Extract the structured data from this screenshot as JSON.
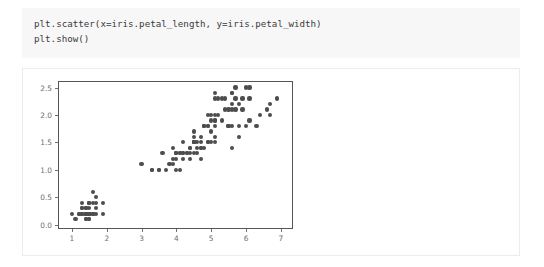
{
  "cell": {
    "code_lines": [
      "plt.scatter(x=iris.petal_length, y=iris.petal_width)",
      "plt.show()"
    ]
  },
  "chart_data": {
    "type": "scatter",
    "title": "",
    "xlabel": "",
    "ylabel": "",
    "xlim": [
      0.6,
      7.35
    ],
    "ylim": [
      -0.08,
      2.62
    ],
    "xticks": [
      1,
      2,
      3,
      4,
      5,
      6,
      7
    ],
    "xtick_labels": [
      "1",
      "2",
      "3",
      "4",
      "5",
      "6",
      "7"
    ],
    "yticks": [
      0.0,
      0.5,
      1.0,
      1.5,
      2.0,
      2.5
    ],
    "ytick_labels": [
      "0.0",
      "0.5",
      "1.0",
      "1.5",
      "2.0",
      "2.5"
    ],
    "grid": false,
    "legend": false,
    "marker_color": "#4d4d4d",
    "marker_size": 4.2,
    "x": [
      1.4,
      1.4,
      1.3,
      1.5,
      1.4,
      1.7,
      1.4,
      1.5,
      1.4,
      1.5,
      1.5,
      1.6,
      1.4,
      1.1,
      1.2,
      1.5,
      1.3,
      1.4,
      1.7,
      1.5,
      1.7,
      1.5,
      1.0,
      1.7,
      1.9,
      1.6,
      1.6,
      1.5,
      1.4,
      1.6,
      1.6,
      1.5,
      1.5,
      1.4,
      1.5,
      1.2,
      1.3,
      1.4,
      1.3,
      1.5,
      1.3,
      1.3,
      1.3,
      1.6,
      1.9,
      1.4,
      1.6,
      1.4,
      1.5,
      1.4,
      4.7,
      4.5,
      4.9,
      4.0,
      4.6,
      4.5,
      4.7,
      3.3,
      4.6,
      3.9,
      3.5,
      4.2,
      4.0,
      4.7,
      3.6,
      4.4,
      4.5,
      4.1,
      4.5,
      3.9,
      4.8,
      4.0,
      4.9,
      4.7,
      4.3,
      4.4,
      4.8,
      5.0,
      4.5,
      3.5,
      3.8,
      3.7,
      3.9,
      5.1,
      4.5,
      4.5,
      4.7,
      4.4,
      4.1,
      4.0,
      4.4,
      4.6,
      4.0,
      3.3,
      4.2,
      4.2,
      4.2,
      4.3,
      3.0,
      4.1,
      6.0,
      5.1,
      5.9,
      5.6,
      5.8,
      6.6,
      4.5,
      6.3,
      5.8,
      6.1,
      5.1,
      5.3,
      5.5,
      5.0,
      5.1,
      5.3,
      5.5,
      6.7,
      6.9,
      5.0,
      5.7,
      4.9,
      6.7,
      4.9,
      5.7,
      6.0,
      4.8,
      4.9,
      5.6,
      5.8,
      6.1,
      6.4,
      5.6,
      5.1,
      5.6,
      6.1,
      5.6,
      5.5,
      4.8,
      5.4,
      5.6,
      5.1,
      5.1,
      5.9,
      5.7,
      5.2,
      5.0,
      5.2,
      5.4,
      5.1
    ],
    "y": [
      0.2,
      0.2,
      0.2,
      0.2,
      0.2,
      0.4,
      0.3,
      0.2,
      0.2,
      0.1,
      0.2,
      0.2,
      0.1,
      0.1,
      0.2,
      0.4,
      0.4,
      0.3,
      0.3,
      0.3,
      0.2,
      0.4,
      0.2,
      0.5,
      0.2,
      0.2,
      0.4,
      0.2,
      0.2,
      0.2,
      0.2,
      0.4,
      0.1,
      0.2,
      0.2,
      0.2,
      0.2,
      0.1,
      0.2,
      0.2,
      0.3,
      0.3,
      0.2,
      0.6,
      0.4,
      0.3,
      0.2,
      0.2,
      0.2,
      0.2,
      1.4,
      1.5,
      1.5,
      1.3,
      1.5,
      1.3,
      1.6,
      1.0,
      1.3,
      1.4,
      1.0,
      1.5,
      1.0,
      1.4,
      1.3,
      1.4,
      1.5,
      1.0,
      1.5,
      1.1,
      1.8,
      1.3,
      1.5,
      1.2,
      1.3,
      1.4,
      1.4,
      1.7,
      1.5,
      1.0,
      1.1,
      1.0,
      1.2,
      1.6,
      1.5,
      1.6,
      1.5,
      1.3,
      1.3,
      1.3,
      1.2,
      1.4,
      1.2,
      1.0,
      1.3,
      1.2,
      1.3,
      1.3,
      1.1,
      1.3,
      2.5,
      1.9,
      2.1,
      1.8,
      2.2,
      2.1,
      1.7,
      1.8,
      1.8,
      2.5,
      2.0,
      1.9,
      2.1,
      2.0,
      2.4,
      2.3,
      1.8,
      2.2,
      2.3,
      1.5,
      2.3,
      2.0,
      2.0,
      1.8,
      2.1,
      1.8,
      1.8,
      1.8,
      2.1,
      1.6,
      1.9,
      2.0,
      2.2,
      1.5,
      1.4,
      2.3,
      2.4,
      1.8,
      1.8,
      2.1,
      2.4,
      2.3,
      1.9,
      2.3,
      2.5,
      2.3,
      1.9,
      2.0,
      2.3,
      1.8
    ]
  }
}
